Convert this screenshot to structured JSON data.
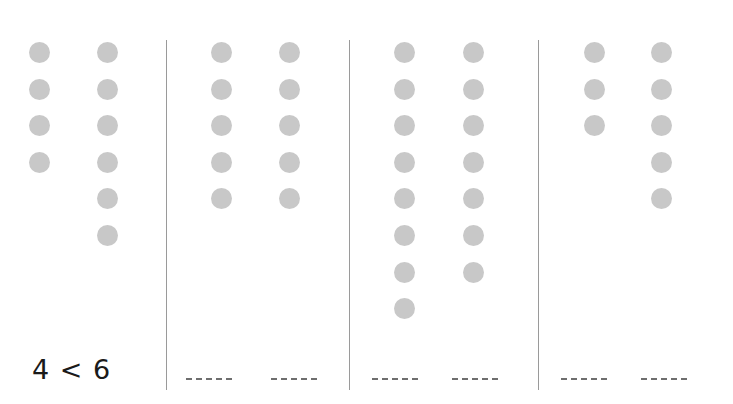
{
  "worksheet": {
    "dot_color": "#c8c8c8",
    "groups": [
      {
        "left_count": 4,
        "right_count": 6,
        "answer": "4 < 6",
        "left_x": 29,
        "right_x": 97
      },
      {
        "left_count": 5,
        "right_count": 5,
        "answer": "",
        "left_x": 211,
        "right_x": 279
      },
      {
        "left_count": 8,
        "right_count": 7,
        "answer": "",
        "left_x": 394,
        "right_x": 463
      },
      {
        "left_count": 3,
        "right_count": 5,
        "answer": "",
        "left_x": 584,
        "right_x": 651
      }
    ],
    "dividers_x": [
      166,
      349,
      538
    ],
    "blanks": [
      {
        "x": 186
      },
      {
        "x": 271
      },
      {
        "x": 372
      },
      {
        "x": 452
      },
      {
        "x": 561
      },
      {
        "x": 641
      }
    ]
  }
}
